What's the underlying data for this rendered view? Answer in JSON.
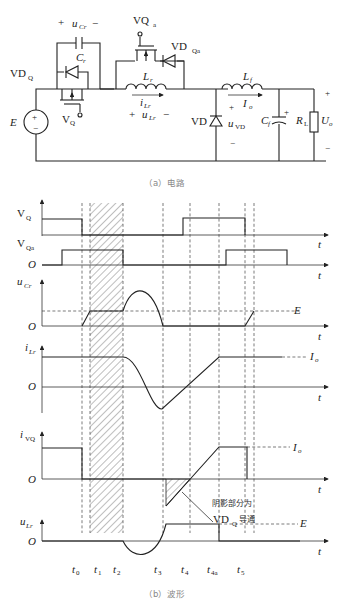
{
  "figure": {
    "caption_a": "（a）电路",
    "caption_b": "（b）波形"
  },
  "circuit": {
    "source_label": "E",
    "source_plus": "+",
    "source_minus": "−",
    "main_switch": "V",
    "main_switch_sub": "Q",
    "main_diode": "VD",
    "main_diode_sub": "Q",
    "resonant_cap": "C",
    "resonant_cap_sub": "r",
    "resonant_cap_voltage": "u",
    "resonant_cap_voltage_sub": "Cr",
    "aux_switch": "VQ",
    "aux_switch_sub": "a",
    "aux_diode": "VD",
    "aux_diode_sub": "Qa",
    "resonant_inductor": "L",
    "resonant_inductor_sub": "r",
    "inductor_current": "i",
    "inductor_current_sub": "Lr",
    "inductor_voltage": "u",
    "inductor_voltage_sub": "Lr",
    "freewheel_diode": "VD",
    "freewheel_voltage": "u",
    "freewheel_voltage_sub": "VD",
    "filter_inductor": "L",
    "filter_inductor_sub": "f",
    "output_current": "I",
    "output_current_sub": "o",
    "filter_cap": "C",
    "filter_cap_sub": "f",
    "load": "R",
    "load_sub": "L",
    "output_voltage": "U",
    "output_voltage_sub": "o",
    "plus": "+",
    "minus": "−"
  },
  "waveforms": {
    "axis_t": "t",
    "origin": "O",
    "traces": [
      {
        "name": "V",
        "sub": "Q"
      },
      {
        "name": "V",
        "sub": "Qa"
      },
      {
        "name": "u",
        "sub": "Cr"
      },
      {
        "name": "i",
        "sub": "Lr"
      },
      {
        "name": "i",
        "sub": "VQ"
      },
      {
        "name": "u",
        "sub": "Lr"
      }
    ],
    "levels": {
      "E": "E",
      "Io": "I",
      "Io_sub": "o"
    },
    "time_marks": [
      {
        "name": "t",
        "sub": "0"
      },
      {
        "name": "t",
        "sub": "1"
      },
      {
        "name": "t",
        "sub": "2"
      },
      {
        "name": "t",
        "sub": "3"
      },
      {
        "name": "t",
        "sub": "4"
      },
      {
        "name": "t",
        "sub": "4a"
      },
      {
        "name": "t",
        "sub": "5"
      }
    ],
    "annotation_line1": "阴影部分为",
    "annotation_line2_main": "VD",
    "annotation_line2_sub": "Q",
    "annotation_line2_tail": "导通"
  }
}
